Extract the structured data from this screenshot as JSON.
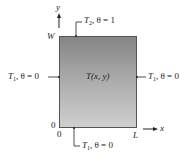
{
  "diagram": {
    "title": "",
    "region": {
      "label": "T(x, y)",
      "fill_top": "#858585",
      "fill_bottom": "#cfcfcf"
    },
    "axes": {
      "y_label": "y",
      "x_label": "x",
      "height_label": "W",
      "length_label": "L",
      "origin_y_label": "0",
      "origin_x_label": "0"
    },
    "boundaries": {
      "top": {
        "T": "T",
        "sub": "2",
        "condition": ", θ = 1"
      },
      "left": {
        "T": "T",
        "sub": "1",
        "condition": ", θ = 0"
      },
      "right": {
        "T": "T",
        "sub": "1",
        "condition": ", θ = 0"
      },
      "bottom": {
        "T": "T",
        "sub": "1",
        "condition": ", θ = 0"
      }
    }
  }
}
